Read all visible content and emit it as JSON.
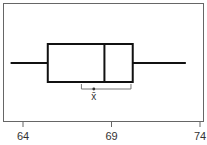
{
  "chart_data": {
    "type": "boxplot",
    "title": "",
    "xlabel": "",
    "ylabel": "",
    "orientation": "horizontal",
    "xlim": [
      62.5,
      74.2
    ],
    "ticks": [
      64,
      69,
      74
    ],
    "tick_labels": [
      "64",
      "69",
      "74"
    ],
    "grid": false,
    "legend": null,
    "box": {
      "whisker_low": 63.3,
      "q1": 65.4,
      "median": 68.6,
      "q3": 70.2,
      "whisker_high": 73.2
    },
    "mean": {
      "value": 68.0,
      "ci_low": 67.3,
      "ci_high": 70.1,
      "label": "x̄"
    }
  },
  "colors": {
    "box": "#111111",
    "frame": "#666666",
    "ci": "#777777"
  }
}
